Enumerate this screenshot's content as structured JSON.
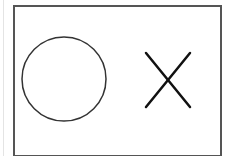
{
  "canvas": {
    "background": "#ffffff",
    "frame_color": "#555555"
  },
  "board": {
    "symbols": [
      {
        "type": "circle",
        "label": "O",
        "cx": 64,
        "cy": 79,
        "r": 42,
        "stroke": "#333333",
        "stroke_width": 1.5
      },
      {
        "type": "cross",
        "label": "X",
        "x1": 146,
        "y1": 53,
        "x2": 190,
        "y2": 107,
        "stroke": "#111111",
        "stroke_width": 2.5
      }
    ]
  }
}
